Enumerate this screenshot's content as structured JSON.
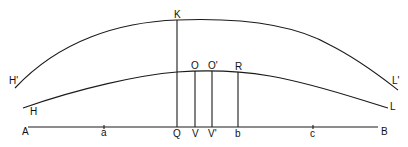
{
  "diagram": {
    "colors": {
      "stroke": "#1a1a1a",
      "background": "#ffffff"
    },
    "labels": {
      "H_prime": "H'",
      "H": "H",
      "K": "K",
      "O": "O",
      "O_prime": "O'",
      "R": "R",
      "L_prime": "L'",
      "L": "L",
      "A": "A",
      "a": "a",
      "Q": "Q",
      "V": "V",
      "V_prime": "V'",
      "b": "b",
      "c": "c",
      "B": "B"
    },
    "curves": [
      {
        "name": "upper-curve",
        "from": "H'",
        "through": "K",
        "to": "L'"
      },
      {
        "name": "lower-curve",
        "from": "H",
        "through": "O",
        "to": "L"
      }
    ],
    "baseline": {
      "from": "A",
      "to": "B",
      "ticks": [
        "a",
        "c"
      ]
    },
    "verticals": [
      {
        "top": "K",
        "bottom": "Q"
      },
      {
        "top": "O",
        "bottom": "V"
      },
      {
        "top": "O'",
        "bottom": "V'"
      },
      {
        "top": "R",
        "bottom": "b"
      }
    ]
  }
}
